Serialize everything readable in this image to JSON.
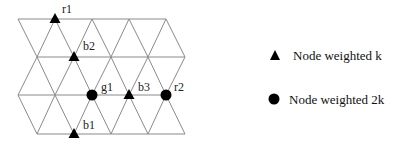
{
  "diagram": {
    "type": "triangular-lattice",
    "rows_y": [
      19,
      57,
      95,
      134
    ],
    "spacing": 37,
    "row_x": [
      [
        18,
        55,
        92,
        129,
        166
      ],
      [
        37,
        74,
        111,
        148,
        185
      ],
      [
        18,
        55,
        92,
        129,
        166
      ],
      [
        37,
        74,
        111,
        148,
        185
      ]
    ],
    "nodes": [
      {
        "id": "r1",
        "label": "r1",
        "kind": "triangle",
        "x": 55,
        "y": 19,
        "lx": 62,
        "ly": 13
      },
      {
        "id": "b2",
        "label": "b2",
        "kind": "triangle",
        "x": 74,
        "y": 57,
        "lx": 83,
        "ly": 50
      },
      {
        "id": "g1",
        "label": "g1",
        "kind": "circle",
        "x": 92,
        "y": 95,
        "lx": 101,
        "ly": 91
      },
      {
        "id": "b3",
        "label": "b3",
        "kind": "triangle",
        "x": 129,
        "y": 95,
        "lx": 138,
        "ly": 91
      },
      {
        "id": "r2",
        "label": "r2",
        "kind": "circle",
        "x": 166,
        "y": 95,
        "lx": 174,
        "ly": 91
      },
      {
        "id": "b1",
        "label": "b1",
        "kind": "triangle",
        "x": 74,
        "y": 134,
        "lx": 83,
        "ly": 129
      }
    ]
  },
  "legend": {
    "items": [
      {
        "symbol": "triangle",
        "label": "Node weighted k"
      },
      {
        "symbol": "circle",
        "label": "Node weighted 2k"
      }
    ]
  },
  "colors": {
    "edge": "#8a8a8a",
    "node": "#000000",
    "text": "#111111"
  }
}
